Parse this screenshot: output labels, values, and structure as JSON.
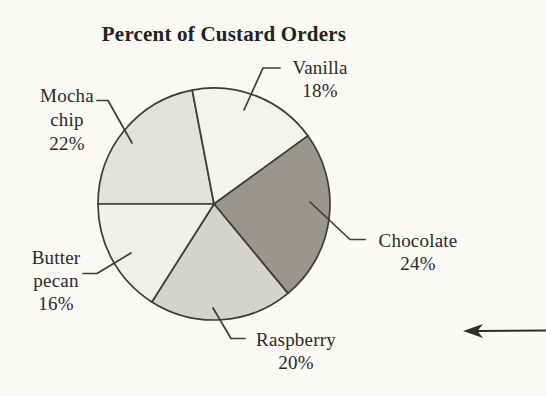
{
  "title": "Percent of Custard Orders",
  "chart_data": {
    "type": "pie",
    "title": "Percent of Custard Orders",
    "unit": "percent",
    "start_angle_deg": 180,
    "direction": "clockwise",
    "slices": [
      {
        "label": "Mocha chip",
        "value": 22,
        "color": "#e3e1dc"
      },
      {
        "label": "Vanilla",
        "value": 18,
        "color": "#f4f3ef"
      },
      {
        "label": "Chocolate",
        "value": 24,
        "color": "#999690"
      },
      {
        "label": "Raspberry",
        "value": 20,
        "color": "#d4d3cf"
      },
      {
        "label": "Butter pecan",
        "value": 16,
        "color": "#f0efeb"
      }
    ],
    "outline_color": "#3c3c3c",
    "legend": "none - slices annotated with leader lines",
    "center": [
      214,
      204
    ],
    "radius": 116
  },
  "labels": {
    "vanilla": [
      "Vanilla",
      "18%"
    ],
    "mocha_chip": [
      "Mocha",
      "chip",
      "22%"
    ],
    "butter_pecan": [
      "Butter",
      "pecan",
      "16%"
    ],
    "raspberry": [
      "Raspberry",
      "20%"
    ],
    "chocolate": [
      "Chocolate",
      "24%"
    ]
  },
  "decorations": {
    "arrow_icon": "left-arrow",
    "arrow_color": "#2e2e2e"
  }
}
